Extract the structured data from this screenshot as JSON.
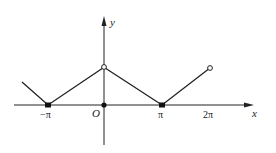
{
  "diagram": {
    "type": "function-graph",
    "axes": {
      "x_label": "x",
      "y_label": "y",
      "origin_label": "O"
    },
    "ticks": [
      {
        "label": "−π",
        "x": -1
      },
      {
        "label": "π",
        "x": 1
      },
      {
        "label": "2π",
        "x": 2
      }
    ],
    "segments": [
      {
        "from": [
          -1.5,
          0.5
        ],
        "to": [
          -1,
          0
        ]
      },
      {
        "from": [
          -1,
          0
        ],
        "to": [
          0,
          1
        ]
      },
      {
        "from": [
          0,
          1
        ],
        "to": [
          1,
          0
        ]
      },
      {
        "from": [
          1,
          0
        ],
        "to": [
          2,
          1
        ]
      }
    ],
    "points": [
      {
        "at": [
          -1,
          0
        ],
        "style": "filled"
      },
      {
        "at": [
          0,
          0
        ],
        "style": "filled"
      },
      {
        "at": [
          1,
          0
        ],
        "style": "filled"
      },
      {
        "at": [
          0,
          1
        ],
        "style": "open"
      },
      {
        "at": [
          2,
          1
        ],
        "style": "open"
      }
    ],
    "x_unit": "π"
  }
}
